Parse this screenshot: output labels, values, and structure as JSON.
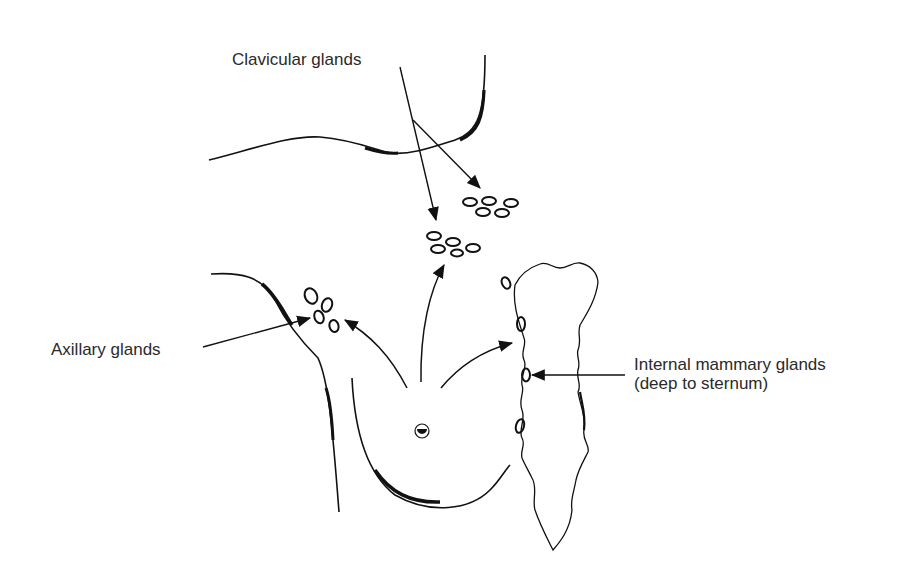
{
  "diagram": {
    "labels": {
      "clavicular": "Clavicular glands",
      "axillary": "Axillary glands",
      "internal_line1": "Internal mammary glands",
      "internal_line2": "(deep to sternum)"
    },
    "structures": [
      "clavicle / neck outline",
      "axilla / arm outline",
      "breast outline",
      "nipple",
      "sternum"
    ],
    "gland_groups": [
      {
        "name": "clavicular-upper",
        "count": 5
      },
      {
        "name": "clavicular-lower",
        "count": 5
      },
      {
        "name": "axillary",
        "count": 4
      },
      {
        "name": "internal-mammary",
        "count": 4
      }
    ],
    "colors": {
      "ink": "#111111",
      "text": "#2a2a2a",
      "background": "#ffffff"
    }
  }
}
